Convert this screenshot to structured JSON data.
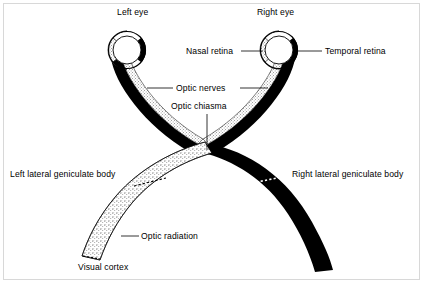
{
  "figure": {
    "background_color": "#ffffff",
    "ink_color": "#000000",
    "frame_color": "#d8d8d8"
  },
  "labels": {
    "left_eye": "Left eye",
    "right_eye": "Right eye",
    "nasal_retina": "Nasal retina",
    "temporal_retina": "Temporal retina",
    "optic_nerves": "Optic nerves",
    "optic_chiasma": "Optic chiasma",
    "left_lateral_geniculate_body": "Left lateral geniculate body",
    "right_lateral_geniculate_body": "Right lateral geniculate body",
    "optic_radiation": "Optic radiation",
    "visual_cortex": "Visual cortex"
  },
  "structures": [
    {
      "name": "left-eye-globe",
      "shape": "circle",
      "cx": 127,
      "cy": 50,
      "rx": 18,
      "ry": 18,
      "fill": "white",
      "stroke": "black"
    },
    {
      "name": "right-eye-globe",
      "shape": "circle",
      "cx": 279,
      "cy": 50,
      "rx": 18,
      "ry": 18,
      "fill": "white",
      "stroke": "black"
    },
    {
      "name": "left-eye-temporal-retina",
      "fill": "stipple",
      "side": "left"
    },
    {
      "name": "left-eye-nasal-retina",
      "fill": "black",
      "side": "right"
    },
    {
      "name": "right-eye-nasal-retina",
      "fill": "stipple",
      "side": "left"
    },
    {
      "name": "right-eye-temporal-retina",
      "fill": "black",
      "side": "right"
    },
    {
      "name": "left-optic-nerve",
      "fill": "black+stipple"
    },
    {
      "name": "right-optic-nerve",
      "fill": "black+stipple"
    },
    {
      "name": "optic-chiasma",
      "cx": 207,
      "cy": 153
    },
    {
      "name": "left-optic-tract-and-radiation",
      "fill": "stipple"
    },
    {
      "name": "right-optic-tract-and-radiation",
      "fill": "black"
    }
  ],
  "leader_lines": [
    {
      "name": "nasal-retina-leader",
      "from": [
        240,
        51
      ],
      "to": [
        265,
        51
      ]
    },
    {
      "name": "temporal-retina-leader",
      "from": [
        297,
        51
      ],
      "to": [
        322,
        51
      ]
    },
    {
      "name": "optic-nerves-leader-left",
      "from": [
        146,
        88
      ],
      "to": [
        173,
        88
      ]
    },
    {
      "name": "optic-nerves-leader-right",
      "from": [
        241,
        88
      ],
      "to": [
        269,
        88
      ]
    },
    {
      "name": "optic-chiasma-leader",
      "from": [
        207,
        114
      ],
      "to": [
        207,
        150
      ]
    },
    {
      "name": "optic-radiation-leader",
      "from": [
        120,
        236
      ],
      "to": [
        138,
        236
      ]
    }
  ]
}
